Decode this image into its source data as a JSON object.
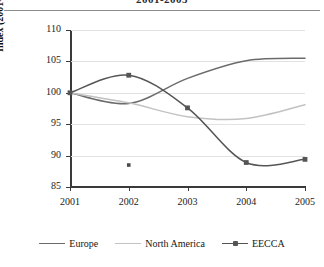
{
  "title": "2001-2005",
  "chart_data": {
    "type": "line",
    "title": "2001-2005",
    "xlabel": "",
    "ylabel": "Index (2001=100)",
    "x": [
      "2001",
      "2002",
      "2003",
      "2004",
      "2005"
    ],
    "categories": [
      "2001",
      "2002",
      "2003",
      "2004",
      "2005"
    ],
    "xlim": [
      2001,
      2005
    ],
    "ylim": [
      85,
      110
    ],
    "yticks": [
      "110",
      "105",
      "100",
      "95",
      "90",
      "85"
    ],
    "ytick_values": [
      110,
      105,
      100,
      95,
      90,
      85
    ],
    "grid": true,
    "legend_position": "bottom",
    "series": [
      {
        "name": "Europe",
        "color": "#6b6b6b",
        "marker": "none",
        "values": [
          100.0,
          98.3,
          102.3,
          105.1,
          105.5
        ]
      },
      {
        "name": "North America",
        "color": "#c2c2c2",
        "marker": "none",
        "values": [
          100.0,
          98.4,
          96.2,
          95.9,
          98.1
        ]
      },
      {
        "name": "EECCA",
        "color": "#555555",
        "marker": "square",
        "values": [
          100.0,
          102.8,
          97.6,
          88.9,
          89.4
        ]
      }
    ],
    "annotations": [
      {
        "name": "stray-point",
        "x": "2002",
        "y": 88.5,
        "color": "#4a4a4a"
      }
    ]
  },
  "axis": {
    "y_title": "Index (2001=100)"
  },
  "legend": {
    "items": [
      {
        "label": "Europe",
        "color": "#6b6b6b",
        "marker": false
      },
      {
        "label": "North America",
        "color": "#c2c2c2",
        "marker": false
      },
      {
        "label": "EECCA",
        "color": "#555555",
        "marker": true
      }
    ]
  }
}
